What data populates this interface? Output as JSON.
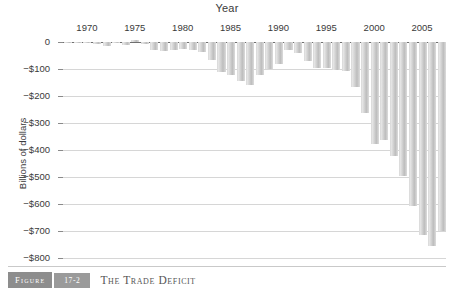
{
  "caption": {
    "figure_label": "Figure",
    "figure_number": "17-2",
    "title": "The Trade Deficit"
  },
  "chart_data": {
    "type": "bar",
    "title": "The Trade Deficit",
    "xlabel": "Year",
    "ylabel": "Billions of dollars",
    "ylim": [
      -800,
      0
    ],
    "ytick_labels": [
      "0",
      "−$100",
      "−$200",
      "−$300",
      "−$400",
      "−$500",
      "−$600",
      "−$700",
      "−$800"
    ],
    "ytick_values": [
      0,
      -100,
      -200,
      -300,
      -400,
      -500,
      -600,
      -700,
      -800
    ],
    "xtick_labels": [
      "1970",
      "1975",
      "1980",
      "1985",
      "1990",
      "1995",
      "2000",
      "2005"
    ],
    "xtick_values": [
      1970,
      1975,
      1980,
      1985,
      1990,
      1995,
      2000,
      2005
    ],
    "grid": true,
    "legend": null,
    "bar_color": "#cfcfcf",
    "categories": [
      1968,
      1969,
      1970,
      1971,
      1972,
      1973,
      1974,
      1975,
      1976,
      1977,
      1978,
      1979,
      1980,
      1981,
      1982,
      1983,
      1984,
      1985,
      1986,
      1987,
      1988,
      1989,
      1990,
      1991,
      1992,
      1993,
      1994,
      1995,
      1996,
      1997,
      1998,
      1999,
      2000,
      2001,
      2002,
      2003,
      2004,
      2005,
      2006,
      2007
    ],
    "values": [
      -1,
      -1,
      -3,
      -9,
      -13,
      -2,
      -10,
      9,
      -9,
      -31,
      -34,
      -28,
      -25,
      -28,
      -36,
      -67,
      -112,
      -122,
      -145,
      -160,
      -121,
      -100,
      -81,
      -31,
      -39,
      -70,
      -98,
      -96,
      -104,
      -108,
      -166,
      -263,
      -378,
      -362,
      -421,
      -495,
      -609,
      -714,
      -754,
      -700
    ]
  }
}
